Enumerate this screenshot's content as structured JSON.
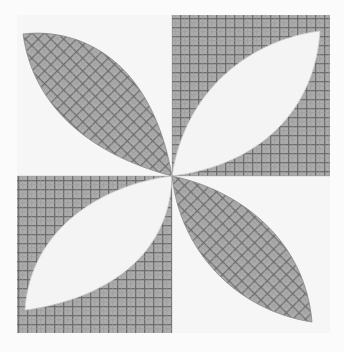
{
  "image": {
    "subject": "quilt block with four leaf petals",
    "colors": {
      "background": "#fbfbfb",
      "white_fabric": "#f4f4f4",
      "plaid_base": "#a9a9a9",
      "plaid_line": "#6f6f6f",
      "seam": "#8a8a8a"
    },
    "block": {
      "x": 17,
      "y": 15,
      "width": 313,
      "height": 318,
      "center_x": 172,
      "center_y": 176
    },
    "quadrants": [
      {
        "name": "top-left",
        "background": "white",
        "petal": "plaid-diagonal"
      },
      {
        "name": "top-right",
        "background": "plaid",
        "petal": "white"
      },
      {
        "name": "bottom-left",
        "background": "plaid",
        "petal": "white"
      },
      {
        "name": "bottom-right",
        "background": "white",
        "petal": "plaid-diagonal"
      }
    ]
  }
}
